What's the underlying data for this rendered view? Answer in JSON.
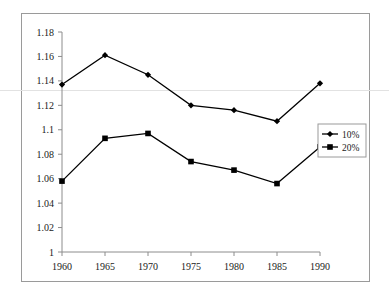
{
  "chart_data": {
    "type": "line",
    "title": "",
    "subtitle": "",
    "xlabel": "",
    "ylabel": "",
    "categories": [
      "1960",
      "1965",
      "1970",
      "1975",
      "1980",
      "1985",
      "1990"
    ],
    "x": [
      1960,
      1965,
      1970,
      1975,
      1980,
      1985,
      1990
    ],
    "series": [
      {
        "name": "10%",
        "marker": "diamond",
        "color": "#000000",
        "values": [
          1.137,
          1.161,
          1.145,
          1.12,
          1.116,
          1.107,
          1.138
        ]
      },
      {
        "name": "20%",
        "marker": "square",
        "color": "#000000",
        "values": [
          1.058,
          1.093,
          1.097,
          1.074,
          1.067,
          1.056,
          1.086
        ]
      }
    ],
    "ylim": [
      1,
      1.18
    ],
    "ytick_step": 0.02,
    "ytick_labels": [
      "1",
      "1.02",
      "1.04",
      "1.06",
      "1.08",
      "1.1",
      "1.12",
      "1.14",
      "1.16",
      "1.18"
    ],
    "ytick_values": [
      1,
      1.02,
      1.04,
      1.06,
      1.08,
      1.1,
      1.12,
      1.14,
      1.16,
      1.18
    ],
    "xtick_labels": [
      "1960",
      "1965",
      "1970",
      "1975",
      "1980",
      "1985",
      "1990"
    ],
    "grid": false,
    "legend": {
      "position": "right-middle",
      "entries": [
        {
          "label": "10%",
          "marker": "diamond"
        },
        {
          "label": "20%",
          "marker": "square"
        }
      ]
    },
    "axis_color": "#8c8c8c",
    "line_color": "#000000",
    "frame_color": "#9a9a9a",
    "background": "#ffffff"
  }
}
